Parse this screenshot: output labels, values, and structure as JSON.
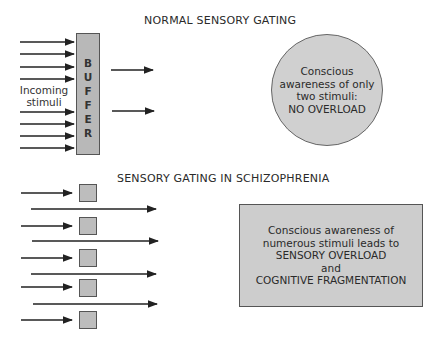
{
  "normal": {
    "title": "NORMAL SENSORY GATING",
    "buffer_letters": [
      "B",
      "U",
      "F",
      "F",
      "E",
      "R"
    ],
    "input_label_line1": "Incoming",
    "input_label_line2": "stimuli",
    "incoming_arrow_count": 8,
    "output_arrow_count": 2,
    "circle_lines": [
      "Conscious",
      "awareness of only",
      "two stimuli:",
      "NO OVERLOAD"
    ]
  },
  "schizophrenia": {
    "title": "SENSORY GATING IN SCHIZOPHRENIA",
    "gate_count": 5,
    "blocked_arrow_count": 5,
    "passing_arrow_count": 4,
    "box_lines": [
      "Conscious awareness of",
      "numerous stimuli leads to",
      "SENSORY OVERLOAD",
      "and",
      "COGNITIVE FRAGMENTATION"
    ]
  },
  "colors": {
    "buffer_fill": "#b8b8b8",
    "circle_fill": "#d0d0d0",
    "box_fill": "#cdcdcd",
    "gate_fill": "#bdbdbd",
    "line": "#222222"
  }
}
